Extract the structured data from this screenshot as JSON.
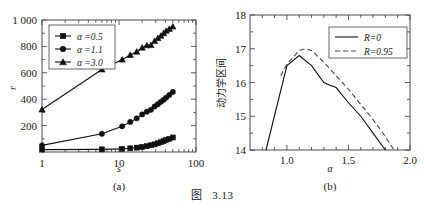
{
  "caption": {
    "prefix": "图",
    "number": "3.13"
  },
  "panels": [
    {
      "id": "a",
      "subcaption": "(a)",
      "xlabel": "s",
      "ylabel": "r"
    },
    {
      "id": "b",
      "subcaption": "(b)",
      "xlabel": "α",
      "ylabel": "动力学区间"
    }
  ],
  "chart_data": [
    {
      "type": "line",
      "panel": "(a)",
      "title": "",
      "xlabel": "s",
      "ylabel": "r",
      "xscale": "log",
      "xlim": [
        1,
        100
      ],
      "ylim": [
        0,
        1000
      ],
      "xticks": [
        1,
        10,
        100
      ],
      "xticklabels": [
        "1",
        "10",
        "100"
      ],
      "yticks": [
        200,
        400,
        600,
        800,
        1000
      ],
      "yticklabels": [
        "200",
        "400",
        "600",
        "800",
        "1 000"
      ],
      "grid": false,
      "legend_position": "upper-left",
      "series": [
        {
          "name": "α =0.5",
          "marker": "square",
          "x": [
            1,
            6,
            11,
            14,
            17,
            20,
            23,
            26,
            29,
            32,
            35,
            38,
            41,
            45,
            50
          ],
          "y": [
            18,
            20,
            24,
            28,
            33,
            38,
            44,
            51,
            58,
            66,
            74,
            82,
            91,
            100,
            110
          ]
        },
        {
          "name": "α =1.1",
          "marker": "circle",
          "x": [
            1,
            6,
            11,
            14,
            17,
            20,
            23,
            26,
            29,
            32,
            35,
            38,
            41,
            45,
            50
          ],
          "y": [
            50,
            138,
            195,
            228,
            255,
            285,
            305,
            320,
            345,
            362,
            380,
            395,
            412,
            432,
            455
          ]
        },
        {
          "name": "α =3.0",
          "marker": "triangle",
          "x": [
            1,
            6,
            11,
            14,
            17,
            20,
            23,
            26,
            29,
            32,
            35,
            38,
            41,
            45,
            50
          ],
          "y": [
            322,
            625,
            700,
            735,
            760,
            790,
            808,
            810,
            840,
            862,
            880,
            900,
            918,
            932,
            950
          ]
        }
      ]
    },
    {
      "type": "line",
      "panel": "(b)",
      "title": "",
      "xlabel": "α",
      "ylabel": "动力学区间",
      "xscale": "linear",
      "xlim": [
        0.7,
        2.0
      ],
      "ylim": [
        14,
        18
      ],
      "xticks": [
        1.0,
        1.5,
        2.0
      ],
      "xticklabels": [
        "1.0",
        "1.5",
        "2.0"
      ],
      "yticks": [
        14,
        15,
        16,
        17,
        18
      ],
      "yticklabels": [
        "14",
        "15",
        "16",
        "17",
        "18"
      ],
      "grid": false,
      "legend_position": "upper-right",
      "series": [
        {
          "name": "R=0",
          "style": "solid",
          "x": [
            0.83,
            1.0,
            1.1,
            1.2,
            1.3,
            1.35,
            1.4,
            1.5,
            1.6,
            1.7,
            1.8
          ],
          "y": [
            14.0,
            16.5,
            16.8,
            16.5,
            16.0,
            15.92,
            15.85,
            15.4,
            15.0,
            14.5,
            14.0
          ]
        },
        {
          "name": "R=0.95",
          "style": "dashed",
          "x": [
            0.95,
            1.0,
            1.1,
            1.15,
            1.2,
            1.3,
            1.4,
            1.5,
            1.6,
            1.7,
            1.8,
            1.87
          ],
          "y": [
            16.2,
            16.55,
            16.95,
            17.0,
            16.95,
            16.6,
            16.2,
            15.8,
            15.35,
            14.9,
            14.4,
            14.0
          ]
        }
      ]
    }
  ],
  "colors": {
    "line": "#111111",
    "dashed": "#444444",
    "frame": "#4a4a52",
    "background": "#ffffff"
  }
}
